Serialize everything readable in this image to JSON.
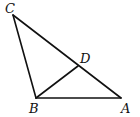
{
  "diagram": {
    "type": "geometry-triangle",
    "stroke_color": "#111111",
    "background": "#ffffff",
    "points": {
      "C": {
        "label": "C",
        "x": 13,
        "y": 15
      },
      "B": {
        "label": "B",
        "x": 36,
        "y": 98
      },
      "A": {
        "label": "A",
        "x": 121,
        "y": 98
      },
      "D": {
        "label": "D",
        "x": 78,
        "y": 66
      }
    },
    "segments": [
      {
        "from": "C",
        "to": "B"
      },
      {
        "from": "C",
        "to": "A"
      },
      {
        "from": "B",
        "to": "A"
      },
      {
        "from": "B",
        "to": "D"
      }
    ],
    "labels": {
      "C": "C",
      "B": "B",
      "A": "A",
      "D": "D"
    }
  }
}
